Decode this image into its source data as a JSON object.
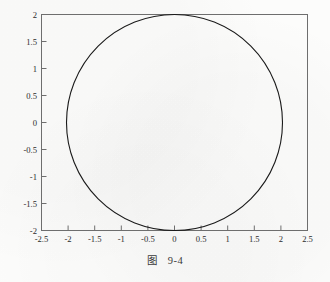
{
  "caption": {
    "text": "图　9-4"
  },
  "chart_data": {
    "type": "line",
    "title": "",
    "xlabel": "",
    "ylabel": "",
    "xlim": [
      -2.5,
      2.5
    ],
    "ylim": [
      -2,
      2
    ],
    "grid": false,
    "legend": null,
    "xticks": [
      "-2.5",
      "-2",
      "-1.5",
      "-1",
      "-0.5",
      "0",
      "0.5",
      "1",
      "1.5",
      "2",
      "2.5"
    ],
    "xtick_values": [
      -2.5,
      -2,
      -1.5,
      -1,
      -0.5,
      0,
      0.5,
      1,
      1.5,
      2,
      2.5
    ],
    "yticks": [
      "2",
      "1.5",
      "1",
      "0.5",
      "0",
      "-0.5",
      "-1",
      "-1.5",
      "-2"
    ],
    "ytick_values": [
      2,
      1.5,
      1,
      0.5,
      0,
      -0.5,
      -1,
      -1.5,
      -2
    ],
    "series": [
      {
        "name": "circle",
        "shape": "circle",
        "center": [
          0,
          0
        ],
        "radius": 2,
        "color": "#1a1a1a",
        "linewidth": 1.1
      }
    ],
    "axes_color": "#6e6e6e",
    "tick_direction": "in"
  }
}
